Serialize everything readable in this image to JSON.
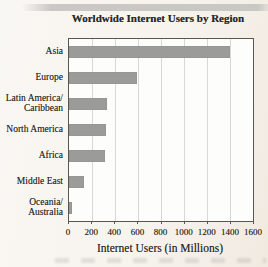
{
  "page": {
    "background": "#f7f4ee"
  },
  "chart_data": {
    "type": "bar",
    "orientation": "horizontal",
    "title": "Worldwide Internet Users by Region",
    "xlabel": "Internet Users (in Millions)",
    "categories": [
      "Asia",
      "Europe",
      "Latin America/Caribbean",
      "North America",
      "Africa",
      "Middle East",
      "Oceania/Australia"
    ],
    "categories_lines": [
      [
        "Asia"
      ],
      [
        "Europe"
      ],
      [
        "Latin America/",
        "Caribbean"
      ],
      [
        "North America"
      ],
      [
        "Africa"
      ],
      [
        "Middle East"
      ],
      [
        "Oceania/",
        "Australia"
      ]
    ],
    "values": [
      1400,
      590,
      330,
      325,
      310,
      130,
      30
    ],
    "xlim": [
      0,
      1600
    ],
    "xticks": [
      0,
      200,
      400,
      600,
      800,
      1000,
      1200,
      1400,
      1600
    ],
    "grid": true,
    "legend": false,
    "bar_color": "#9b9b99"
  },
  "colors": {
    "bar": "#9b9b99",
    "plot_background": "#fdfdfc",
    "gridline": "#d9d7d1",
    "frame": "#57564f",
    "text": "#2a2927",
    "page_background": "#f7f4ee",
    "scan_band": "#c9c8c4"
  }
}
